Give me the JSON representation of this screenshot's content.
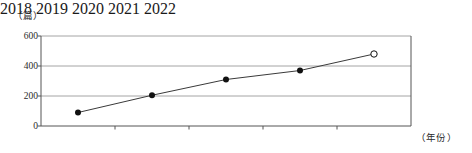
{
  "chart_data": {
    "type": "line",
    "title": "",
    "xlabel": "（年份）",
    "ylabel": "（篇）",
    "categories": [
      "2018",
      "2019",
      "2020",
      "2021",
      "2022"
    ],
    "values": [
      90,
      205,
      310,
      370,
      480
    ],
    "series": [
      {
        "name": "篇数",
        "values": [
          90,
          205,
          310,
          370,
          480
        ],
        "marker_styles": [
          "filled",
          "filled",
          "filled",
          "filled",
          "hollow"
        ]
      }
    ],
    "ylim": [
      0,
      600
    ],
    "y_ticks": [
      "0",
      "200",
      "400",
      "600"
    ],
    "y_tick_values": [
      0,
      200,
      400,
      600
    ],
    "x_ticks": [
      "2018",
      "2019",
      "2020",
      "2021",
      "2022"
    ],
    "grid": true,
    "grid_axis": "y",
    "legend": false,
    "legend_position": "none",
    "line_color": "#3a3a3a",
    "marker_color": "#111111",
    "grid_color": "#9a9a9a",
    "axis_color": "#555555",
    "background_color": "#ffffff",
    "annotations": [
      {
        "category": "2022",
        "value": 480,
        "style": "hollow-marker"
      }
    ]
  }
}
